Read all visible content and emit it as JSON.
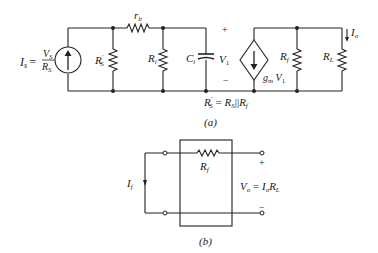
{
  "figure_a": {
    "caption": "(a)",
    "source": {
      "label_lhs": "I",
      "label_lhs_sub": "s",
      "eq": "=",
      "num": "V",
      "num_sub": "S",
      "den": "R",
      "den_sub": "S"
    },
    "rs_prime": {
      "label": "R",
      "sub": "S",
      "prime": "′"
    },
    "rb": {
      "label": "r",
      "sub": "b"
    },
    "ri": {
      "label": "R",
      "sub": "i"
    },
    "ci": {
      "label": "C",
      "sub": "i"
    },
    "v1": {
      "label": "V",
      "sub": "1",
      "plus": "+",
      "minus": "−"
    },
    "dep_source": {
      "label": "g",
      "sub": "m",
      "tail": " V",
      "tail_sub": "1"
    },
    "rf": {
      "label": "R",
      "sub": "f"
    },
    "rl": {
      "label": "R",
      "sub": "L"
    },
    "io": {
      "label": "I",
      "sub": "o"
    },
    "equation": {
      "lhs": "R",
      "lhs_sub": "S",
      "lhs_prime": "′",
      "eq": " = ",
      "r1": "R",
      "r1_sub": "S",
      "par": "||",
      "r2": "R",
      "r2_sub": "f"
    }
  },
  "figure_b": {
    "caption": "(b)",
    "rf": {
      "label": "R",
      "sub": "f"
    },
    "if": {
      "label": "I",
      "sub": "f"
    },
    "vo": {
      "label": "V",
      "sub": "o",
      "eq": " = ",
      "i": "I",
      "i_sub": "o",
      "r": "R",
      "r_sub": "L"
    },
    "plus": "+",
    "minus": "−"
  }
}
